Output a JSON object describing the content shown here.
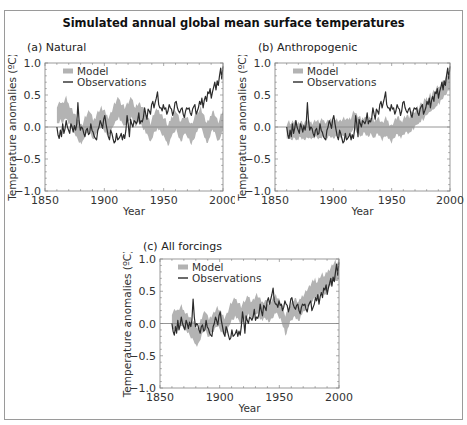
{
  "chart_data": {
    "title": "Simulated annual global mean surface temperatures",
    "panels": [
      {
        "id": "a",
        "type": "line",
        "subtitle": "(a) Natural",
        "xlabel": "Year",
        "ylabel": "Temperature anomalies (ºC)",
        "xlim": [
          1850,
          2000
        ],
        "ylim": [
          -1.0,
          1.0
        ],
        "xticks": [
          "1850",
          "1900",
          "1950",
          "2000"
        ],
        "yticks": [
          "1.0",
          "0.5",
          "0.0",
          "-0.5",
          "-1.0"
        ],
        "legend": [
          "Model",
          "Observations"
        ],
        "legend_position": "top-left",
        "model_center": [
          0.18,
          0.2,
          0.22,
          0.25,
          0.22,
          0.2,
          0.24,
          0.28,
          0.3,
          0.25,
          0.2,
          0.18,
          0.15,
          0.12,
          0.08,
          0.05,
          0.02,
          -0.02,
          -0.05,
          -0.08,
          -0.1,
          -0.12,
          -0.1,
          -0.05,
          0.0,
          0.02,
          0.05,
          0.08,
          0.1,
          0.05,
          0.0,
          -0.05,
          -0.03,
          0.0,
          0.05,
          0.08,
          0.1,
          0.12,
          0.15,
          0.12,
          0.1,
          0.08,
          0.05,
          0.02,
          0.0,
          0.03,
          0.06,
          0.1,
          0.15,
          0.2,
          0.22,
          0.25,
          0.28,
          0.3,
          0.25,
          0.22,
          0.2,
          0.18,
          0.15,
          0.18,
          0.2,
          0.22,
          0.25,
          0.28,
          0.3,
          0.25,
          0.2,
          0.15,
          0.18,
          0.2,
          0.22,
          0.2,
          0.18,
          0.15,
          0.12,
          0.1,
          0.05,
          0.02,
          0.0,
          -0.05,
          -0.1,
          -0.05,
          0.0,
          0.05,
          0.08,
          0.1,
          0.12,
          0.1,
          0.08,
          0.05,
          0.02,
          0.0,
          -0.02,
          -0.05,
          -0.1,
          -0.15,
          -0.1,
          -0.05,
          0.0,
          0.02,
          0.05,
          0.08,
          0.1,
          0.05,
          0.0,
          -0.05,
          -0.08,
          -0.05,
          0.0,
          0.05,
          0.02,
          0.0,
          -0.02,
          -0.05,
          -0.1,
          -0.12,
          -0.08,
          -0.05,
          0.0,
          0.05,
          0.08,
          0.1,
          0.12,
          0.15,
          0.1,
          0.05,
          0.0,
          -0.05,
          -0.1,
          -0.08,
          -0.05,
          0.0,
          0.05,
          0.1,
          0.08,
          0.05,
          0.0,
          -0.05,
          -0.08,
          -0.05,
          0.02,
          0.05,
          0.1
        ],
        "model_halfwidth": 0.12
      },
      {
        "id": "b",
        "type": "line",
        "subtitle": "(b) Anthropogenic",
        "xlabel": "Year",
        "ylabel": "Temperature anomalies (ºC)",
        "xlim": [
          1850,
          2000
        ],
        "ylim": [
          -1.0,
          1.0
        ],
        "xticks": [
          "1850",
          "1900",
          "1950",
          "2000"
        ],
        "yticks": [
          "1.0",
          "0.5",
          "0.0",
          "-0.5",
          "-1.0"
        ],
        "legend": [
          "Model",
          "Observations"
        ],
        "legend_position": "top-left",
        "model_center": [
          -0.08,
          -0.06,
          -0.05,
          -0.07,
          -0.08,
          -0.06,
          -0.05,
          -0.04,
          -0.06,
          -0.08,
          -0.07,
          -0.05,
          -0.04,
          -0.06,
          -0.07,
          -0.08,
          -0.06,
          -0.05,
          -0.04,
          -0.03,
          -0.05,
          -0.06,
          -0.07,
          -0.05,
          -0.04,
          -0.03,
          -0.04,
          -0.05,
          -0.06,
          -0.04,
          -0.03,
          -0.02,
          -0.04,
          -0.05,
          -0.06,
          -0.04,
          -0.03,
          -0.02,
          -0.03,
          -0.04,
          -0.05,
          -0.03,
          -0.02,
          -0.01,
          -0.02,
          -0.03,
          -0.04,
          -0.02,
          -0.01,
          0.0,
          -0.01,
          -0.02,
          -0.03,
          -0.01,
          0.0,
          0.01,
          0.05,
          0.1,
          0.12,
          0.08,
          0.05,
          0.03,
          0.02,
          0.0,
          -0.02,
          0.0,
          0.02,
          0.03,
          0.0,
          -0.02,
          -0.03,
          0.0,
          0.02,
          0.0,
          -0.02,
          -0.05,
          -0.03,
          0.0,
          0.02,
          0.0,
          -0.03,
          -0.05,
          -0.08,
          -0.05,
          -0.02,
          0.0,
          -0.02,
          -0.05,
          -0.08,
          -0.1,
          -0.12,
          -0.08,
          -0.05,
          -0.02,
          0.0,
          0.02,
          0.0,
          -0.02,
          -0.05,
          -0.03,
          0.0,
          0.02,
          0.03,
          0.05,
          0.03,
          0.02,
          0.05,
          0.08,
          0.1,
          0.08,
          0.12,
          0.15,
          0.18,
          0.15,
          0.2,
          0.22,
          0.25,
          0.22,
          0.28,
          0.3,
          0.32,
          0.3,
          0.35,
          0.38,
          0.35,
          0.4,
          0.42,
          0.4,
          0.45,
          0.48,
          0.5,
          0.48,
          0.52,
          0.55,
          0.58,
          0.6,
          0.62,
          0.65,
          0.68,
          0.7,
          0.72
        ],
        "model_halfwidth": 0.1
      },
      {
        "id": "c",
        "type": "line",
        "subtitle": "(c) All forcings",
        "xlabel": "Year",
        "ylabel": "Temperature anomalies (ºC)",
        "xlim": [
          1850,
          2000
        ],
        "ylim": [
          -1.0,
          1.0
        ],
        "xticks": [
          "1850",
          "1900",
          "1950",
          "2000"
        ],
        "yticks": [
          "1.0",
          "0.5",
          "0.0",
          "-0.5",
          "-1.0"
        ],
        "legend": [
          "Model",
          "Observations"
        ],
        "legend_position": "top-left",
        "model_center": [
          0.02,
          0.04,
          0.06,
          0.08,
          0.06,
          0.04,
          0.08,
          0.1,
          0.12,
          0.08,
          0.05,
          0.04,
          0.02,
          0.0,
          -0.02,
          -0.05,
          -0.08,
          -0.1,
          -0.12,
          -0.15,
          -0.2,
          -0.22,
          -0.2,
          -0.15,
          -0.1,
          -0.05,
          0.0,
          0.02,
          0.05,
          0.0,
          -0.05,
          -0.08,
          -0.05,
          -0.02,
          0.0,
          0.02,
          0.05,
          0.08,
          0.1,
          0.08,
          0.05,
          0.02,
          0.0,
          -0.02,
          -0.05,
          -0.02,
          0.0,
          0.05,
          0.1,
          0.15,
          0.18,
          0.2,
          0.22,
          0.25,
          0.22,
          0.2,
          0.18,
          0.15,
          0.12,
          0.15,
          0.18,
          0.2,
          0.22,
          0.25,
          0.28,
          0.25,
          0.22,
          0.2,
          0.22,
          0.25,
          0.28,
          0.3,
          0.28,
          0.25,
          0.22,
          0.2,
          0.18,
          0.2,
          0.22,
          0.2,
          0.18,
          0.15,
          0.18,
          0.2,
          0.22,
          0.25,
          0.28,
          0.3,
          0.28,
          0.25,
          0.22,
          0.2,
          0.15,
          0.1,
          0.05,
          -0.05,
          0.0,
          0.05,
          0.1,
          0.15,
          0.18,
          0.2,
          0.22,
          0.25,
          0.22,
          0.2,
          0.18,
          0.2,
          0.25,
          0.28,
          0.3,
          0.32,
          0.35,
          0.38,
          0.4,
          0.42,
          0.45,
          0.48,
          0.5,
          0.52,
          0.55,
          0.52,
          0.5,
          0.55,
          0.58,
          0.6,
          0.62,
          0.6,
          0.58,
          0.62,
          0.65,
          0.68,
          0.7,
          0.72,
          0.75,
          0.78,
          0.8,
          0.82,
          0.78,
          0.8,
          0.85
        ],
        "model_halfwidth": 0.11
      }
    ],
    "observations": {
      "x_start": 1860,
      "x_end": 2000,
      "values": [
        0.0,
        -0.12,
        -0.18,
        -0.05,
        -0.15,
        0.05,
        -0.1,
        -0.02,
        0.1,
        0.0,
        -0.05,
        -0.1,
        0.05,
        0.0,
        -0.08,
        0.02,
        -0.05,
        0.05,
        0.38,
        0.1,
        -0.05,
        0.0,
        -0.02,
        -0.1,
        -0.15,
        -0.05,
        -0.02,
        -0.12,
        -0.1,
        0.05,
        -0.05,
        -0.08,
        -0.15,
        -0.18,
        -0.2,
        -0.05,
        0.0,
        0.1,
        0.05,
        -0.02,
        0.12,
        0.18,
        0.05,
        -0.05,
        -0.15,
        -0.2,
        -0.05,
        -0.1,
        -0.18,
        -0.25,
        -0.22,
        -0.1,
        -0.2,
        -0.18,
        -0.15,
        -0.1,
        -0.2,
        -0.12,
        -0.18,
        -0.05,
        0.18,
        0.05,
        -0.15,
        0.12,
        0.05,
        0.0,
        0.1,
        0.08,
        0.05,
        0.1,
        0.22,
        0.05,
        0.1,
        0.08,
        0.15,
        0.3,
        0.2,
        0.12,
        0.28,
        0.25,
        0.2,
        0.35,
        0.4,
        0.3,
        0.38,
        0.45,
        0.55,
        0.35,
        0.3,
        0.3,
        0.25,
        0.35,
        0.28,
        0.3,
        0.2,
        0.25,
        0.35,
        0.3,
        0.28,
        0.18,
        0.25,
        0.38,
        0.4,
        0.3,
        0.25,
        0.22,
        0.28,
        0.3,
        0.2,
        0.15,
        0.25,
        0.3,
        0.28,
        0.3,
        0.22,
        0.18,
        0.28,
        0.32,
        0.35,
        0.2,
        0.25,
        0.3,
        0.4,
        0.35,
        0.45,
        0.3,
        0.42,
        0.48,
        0.4,
        0.55,
        0.52,
        0.6,
        0.45,
        0.55,
        0.62,
        0.7,
        0.58,
        0.72,
        0.65,
        0.8,
        0.92,
        0.75,
        0.95
      ]
    }
  }
}
